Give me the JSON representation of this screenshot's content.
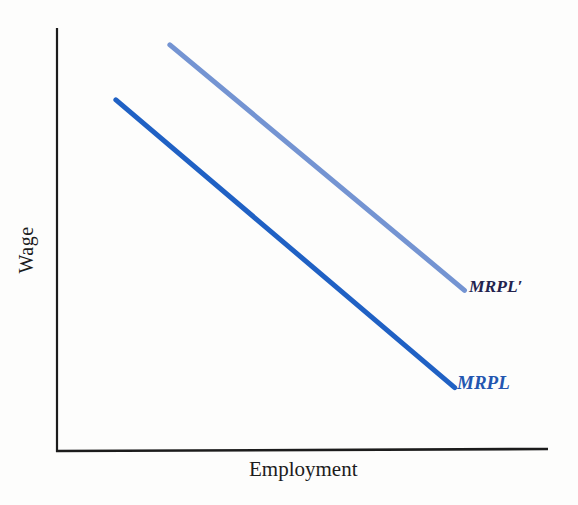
{
  "figure": {
    "background": "#fdfdfc"
  },
  "axes": {
    "y_label": "Wage",
    "x_label": "Employment",
    "color": "#1c1c1c"
  },
  "labels": {
    "mrpl_prime": "MRPL′",
    "mrpl": "MRPL"
  },
  "colors": {
    "mrpl_line": "#2061c4",
    "mrpl_prime_line": "#7494d2",
    "mrpl_label": "#2356b0",
    "mrpl_prime_label": "#23234e"
  },
  "chart_data": {
    "type": "line",
    "title": "",
    "xlabel": "Employment",
    "ylabel": "Wage",
    "axis_numeric_labels": false,
    "xlim": [
      0,
      1
    ],
    "ylim": [
      0,
      1
    ],
    "grid": false,
    "legend": "inline-labels-at-line-ends",
    "series": [
      {
        "name": "MRPL",
        "color": "#2061c4",
        "stroke_width": 5,
        "x": [
          0.12,
          0.81
        ],
        "y": [
          0.83,
          0.15
        ]
      },
      {
        "name": "MRPL′",
        "color": "#7494d2",
        "stroke_width": 5,
        "x": [
          0.23,
          0.83
        ],
        "y": [
          0.96,
          0.38
        ]
      }
    ]
  }
}
